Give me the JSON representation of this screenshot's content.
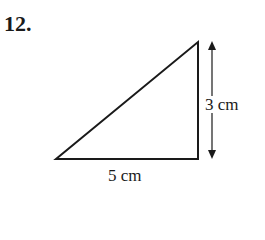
{
  "question": {
    "number": "12."
  },
  "diagram": {
    "shape": "right-triangle",
    "base_label": "5 cm",
    "height_label": "3 cm",
    "vertices": [
      [
        56,
        159
      ],
      [
        198,
        159
      ],
      [
        198,
        42
      ]
    ],
    "stroke_color": "#1a1a1a"
  }
}
